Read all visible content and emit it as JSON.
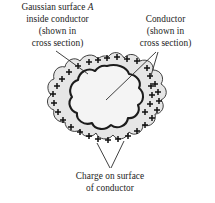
{
  "figure": {
    "colors": {
      "outline": "#2b2b2b",
      "conductor_fill": "#e6e6e6",
      "cavity_fill": "#f2f2f2",
      "gaussian_line": "#1c1c1c",
      "charge_sign": "#111111",
      "leader_line": "#2b2b2b",
      "text": "#1c1c1c",
      "background": "#ffffff"
    }
  },
  "labels": {
    "gaussian": {
      "line1_prefix": "Gaussian surface ",
      "line1_symbol": "A",
      "line2": "inside conductor",
      "line3": "(shown in",
      "line4": "cross section)"
    },
    "conductor": {
      "line1": "Conductor",
      "line2": "(shown in",
      "line3": "cross section)"
    },
    "charge": {
      "line1": "Charge on surface",
      "line2": "of conductor"
    }
  },
  "annotations": {
    "charge_symbol": "+",
    "charge_count": 34,
    "gaussian_surface_name": "gaussian-surface-A",
    "conductor_name": "conductor-cross-section"
  }
}
